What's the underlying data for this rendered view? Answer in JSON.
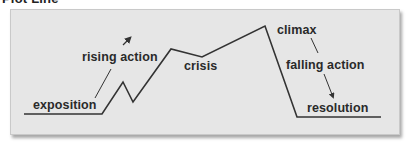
{
  "title": "Plot Line",
  "colors": {
    "panel_bg": "#e6e6e6",
    "line": "#333333",
    "text": "#2a2a2a"
  },
  "labels": {
    "exposition": "exposition",
    "rising_action": "rising action",
    "crisis": "crisis",
    "climax": "climax",
    "falling_action": "falling action",
    "resolution": "resolution"
  },
  "plot_line_points": [
    [
      24,
      114
    ],
    [
      102,
      114
    ],
    [
      123,
      82
    ],
    [
      133,
      102
    ],
    [
      171,
      49
    ],
    [
      202,
      57
    ],
    [
      265,
      26
    ],
    [
      297,
      117
    ],
    [
      381,
      117
    ]
  ]
}
